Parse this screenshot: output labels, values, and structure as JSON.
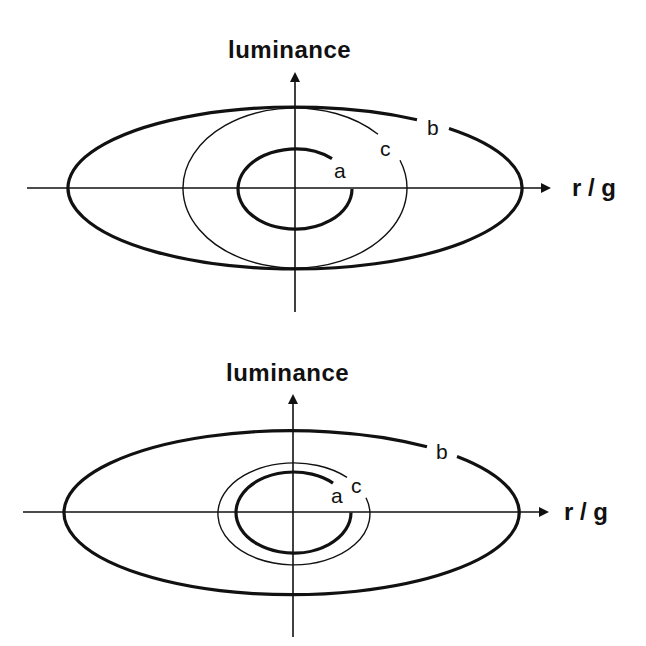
{
  "figure": {
    "panels": [
      {
        "id": "top",
        "y_axis_label": "luminance",
        "x_axis_label": "r / g",
        "curves": [
          {
            "label": "a",
            "weight": "thick"
          },
          {
            "label": "b",
            "weight": "thick"
          },
          {
            "label": "c",
            "weight": "thin"
          }
        ]
      },
      {
        "id": "bottom",
        "y_axis_label": "luminance",
        "x_axis_label": "r / g",
        "curves": [
          {
            "label": "a",
            "weight": "thick"
          },
          {
            "label": "b",
            "weight": "thick"
          },
          {
            "label": "c",
            "weight": "thin"
          }
        ]
      }
    ],
    "colors": {
      "line": "#111111",
      "background": "#ffffff"
    }
  }
}
